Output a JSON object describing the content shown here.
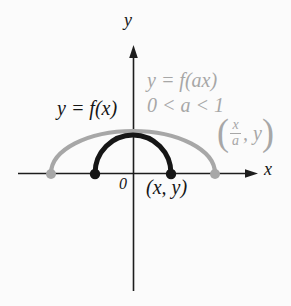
{
  "figure": {
    "background": "#fbfbfb",
    "colors": {
      "ink": "#161616",
      "gray": "#a7a7a7",
      "axis": "#1d1d1d"
    },
    "axes": {
      "x_label": "x",
      "y_label": "y",
      "origin_label": "0"
    },
    "curves": {
      "base": {
        "label": "y = f(x)",
        "description": "black semicircular arc from (95,173) to (171,173), peak height 38px"
      },
      "stretched": {
        "label": "y = f(ax)",
        "condition": "0 < a < 1",
        "description": "gray elliptical arc from (51,173) to (215,173), peak height 42px"
      }
    },
    "points": {
      "on_base": {
        "label": "(x, y)"
      },
      "on_stretched": {
        "open_paren": "(",
        "numerator": "x",
        "denominator": "a",
        "rest": ", y",
        "close_paren": ")"
      }
    }
  }
}
